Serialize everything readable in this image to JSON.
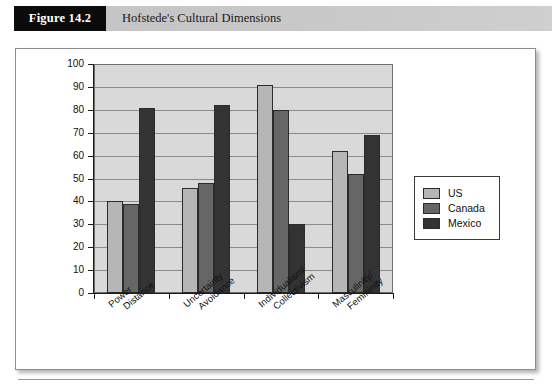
{
  "figure": {
    "number_label": "Figure 14.2",
    "title": "Hofstede's Cultural Dimensions"
  },
  "colors": {
    "us": "#b6b6b6",
    "canada": "#666666",
    "mexico": "#333333",
    "plot_background": "#d9d9d9",
    "header_band": "#c8c8c8",
    "number_box": "#0b0b0b"
  },
  "chart_data": {
    "type": "bar",
    "title": "Hofstede's Cultural Dimensions",
    "xlabel": "",
    "ylabel": "",
    "ylim": [
      0,
      100
    ],
    "y_ticks": [
      0,
      10,
      20,
      30,
      40,
      50,
      60,
      70,
      80,
      90,
      100
    ],
    "grid": true,
    "legend_position": "right",
    "categories": [
      "Power Distance",
      "Uncertainty Avoidance",
      "Individualism/ Collectivism",
      "Masculinity/ Femininity"
    ],
    "category_lines": [
      [
        "Power",
        "Distance"
      ],
      [
        "Uncertainty",
        "Avoidance"
      ],
      [
        "Individualism/",
        "Collectivism"
      ],
      [
        "Masculinity/",
        "Femininity"
      ]
    ],
    "series": [
      {
        "name": "US",
        "color": "#b6b6b6",
        "values": [
          40,
          46,
          91,
          62
        ]
      },
      {
        "name": "Canada",
        "color": "#666666",
        "values": [
          39,
          48,
          80,
          52
        ]
      },
      {
        "name": "Mexico",
        "color": "#333333",
        "values": [
          81,
          82,
          30,
          69
        ]
      }
    ]
  },
  "legend": {
    "items": [
      {
        "label": "US",
        "color": "#b6b6b6"
      },
      {
        "label": "Canada",
        "color": "#666666"
      },
      {
        "label": "Mexico",
        "color": "#333333"
      }
    ]
  }
}
